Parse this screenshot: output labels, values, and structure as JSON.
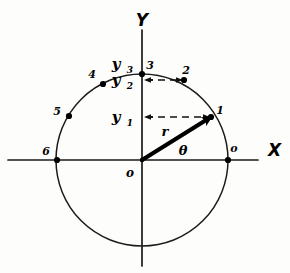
{
  "figure": {
    "background_color": "#fdfdfc",
    "ink_color": "#000000"
  },
  "axes": {
    "x_label": "X",
    "y_label": "Y",
    "x_axis": {
      "x1": 8,
      "y1": 160,
      "x2": 258,
      "y2": 160
    },
    "y_axis": {
      "x1": 142,
      "y1": 30,
      "x2": 142,
      "y2": 266
    },
    "x_label_pos": {
      "x": 268,
      "y": 156
    },
    "y_label_pos": {
      "x": 142,
      "y": 26
    }
  },
  "circle": {
    "cx": 142,
    "cy": 160,
    "r": 86
  },
  "origin": {
    "label": "o",
    "x": 142,
    "y": 160,
    "label_pos": {
      "x": 130,
      "y": 177
    }
  },
  "radius_vector": {
    "label": "r",
    "theta_label": "θ",
    "from": {
      "x": 142,
      "y": 160
    },
    "to": {
      "x": 211,
      "y": 117
    },
    "r_label_pos": {
      "x": 165,
      "y": 136
    },
    "theta_label_pos": {
      "x": 183,
      "y": 155
    }
  },
  "circle_points": [
    {
      "label": "1",
      "cx": 211,
      "cy": 117,
      "lx": 220,
      "ly": 114
    },
    {
      "label": "2",
      "cx": 184,
      "cy": 80,
      "lx": 186,
      "ly": 74
    },
    {
      "label": "3",
      "cx": 142,
      "cy": 74,
      "lx": 150,
      "ly": 69
    },
    {
      "label": "4",
      "cx": 103,
      "cy": 84,
      "lx": 92,
      "ly": 78
    },
    {
      "label": "5",
      "cx": 69,
      "cy": 116,
      "lx": 57,
      "ly": 115
    },
    {
      "label": "6",
      "cx": 57,
      "cy": 160,
      "lx": 46,
      "ly": 155
    },
    {
      "label": "o",
      "cx": 228,
      "cy": 160,
      "lx": 234,
      "ly": 152
    }
  ],
  "projections": [
    {
      "label": "y",
      "subscript": "1",
      "axis_x": 142,
      "y": 117,
      "to_x": 209,
      "label_pos": {
        "x": 116,
        "y": 122
      },
      "sub_pos": {
        "x": 130,
        "y": 126
      }
    },
    {
      "label": "y",
      "subscript": "2",
      "axis_x": 142,
      "y": 80,
      "to_x": 182,
      "label_pos": {
        "x": 116,
        "y": 85
      },
      "sub_pos": {
        "x": 130,
        "y": 89
      }
    },
    {
      "label": "y",
      "subscript": "3",
      "axis_x": 142,
      "y": 74,
      "to_x": 142,
      "label_pos": {
        "x": 116,
        "y": 69
      },
      "sub_pos": {
        "x": 130,
        "y": 73
      }
    }
  ]
}
